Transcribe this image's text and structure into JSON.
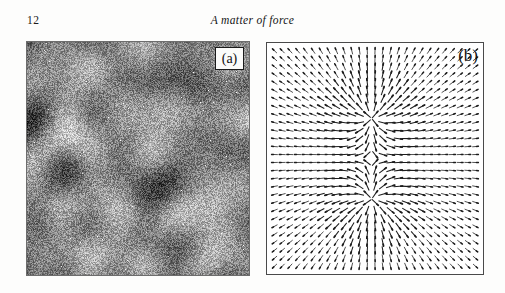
{
  "page": {
    "number": "12",
    "running_title": "A matter of force",
    "background_color": "#fdfdfc",
    "text_color": "#141414"
  },
  "figure": {
    "panels": [
      {
        "id": "a",
        "label": "(a)",
        "kind": "speckle-intensity-image",
        "label_boxed": true,
        "label_position": "top-right",
        "rect": {
          "x": 27,
          "y": 42,
          "width": 222,
          "height": 233
        },
        "appearance": {
          "mean_gray": "#7e7e7e",
          "bright_spot_color": "#f2f2f2",
          "dark_blob_color": "#3a3a3a",
          "border_color": "#6d6d6d"
        }
      },
      {
        "id": "b",
        "label": "(b)",
        "kind": "vector-field-quiver",
        "label_boxed": false,
        "label_position": "top-right",
        "rect": {
          "x": 266,
          "y": 42,
          "width": 218,
          "height": 233
        },
        "appearance": {
          "background": "#ffffff",
          "border_color": "#4a4a4a",
          "arrow_color": "#1c1c1c"
        }
      }
    ]
  },
  "chart_data": {
    "type": "scatter",
    "title": "",
    "xlabel": "",
    "ylabel": "",
    "subplots": [
      {
        "panel": "a",
        "type": "heatmap",
        "description": "Grayscale speckle intensity pattern, random interference field with bright filaments and dark vortex cores",
        "grid": false,
        "colormap": "gray",
        "value_range": [
          0,
          1
        ],
        "mean_level": 0.49,
        "noise_sigma": 0.17,
        "num_blobs": 46,
        "blob_radius_range": [
          6,
          30
        ]
      },
      {
        "panel": "b",
        "type": "quiver",
        "description": "Vector field showing phase gradient of the speckle pattern with two radial singular points on the vertical midline",
        "grid": false,
        "xlim": [
          0,
          1
        ],
        "ylim": [
          0,
          1
        ],
        "grid_cols": 27,
        "grid_rows": 28,
        "arrow_scale": 0.95,
        "singularities": [
          {
            "name": "upper-node",
            "x": 0.485,
            "y": 0.325,
            "charge": 1,
            "type": "source"
          },
          {
            "name": "lower-node",
            "x": 0.485,
            "y": 0.678,
            "charge": 1,
            "type": "source"
          }
        ]
      }
    ]
  }
}
